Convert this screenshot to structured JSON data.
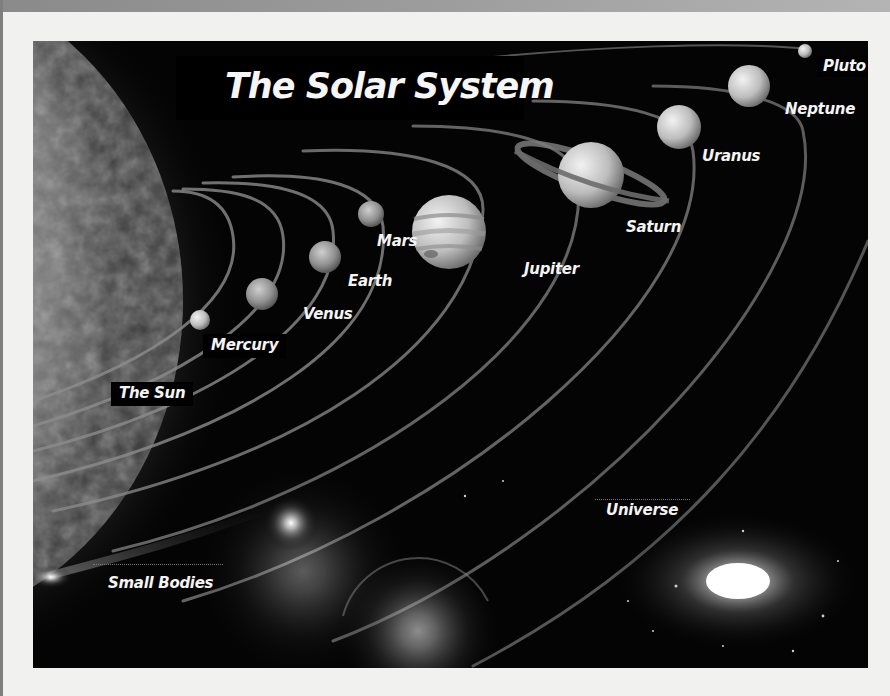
{
  "title": "The Solar System",
  "labels": {
    "sun": "The Sun",
    "mercury": "Mercury",
    "venus": "Venus",
    "earth": "Earth",
    "mars": "Mars",
    "jupiter": "Jupiter",
    "saturn": "Saturn",
    "uranus": "Uranus",
    "neptune": "Neptune",
    "pluto": "Pluto",
    "small_bodies": "Small Bodies",
    "universe": "Universe"
  },
  "colors": {
    "page": "#f1f1f0",
    "space": "#040404",
    "label_text": "#f4f4f4",
    "orbit": "#8c8c8c"
  }
}
